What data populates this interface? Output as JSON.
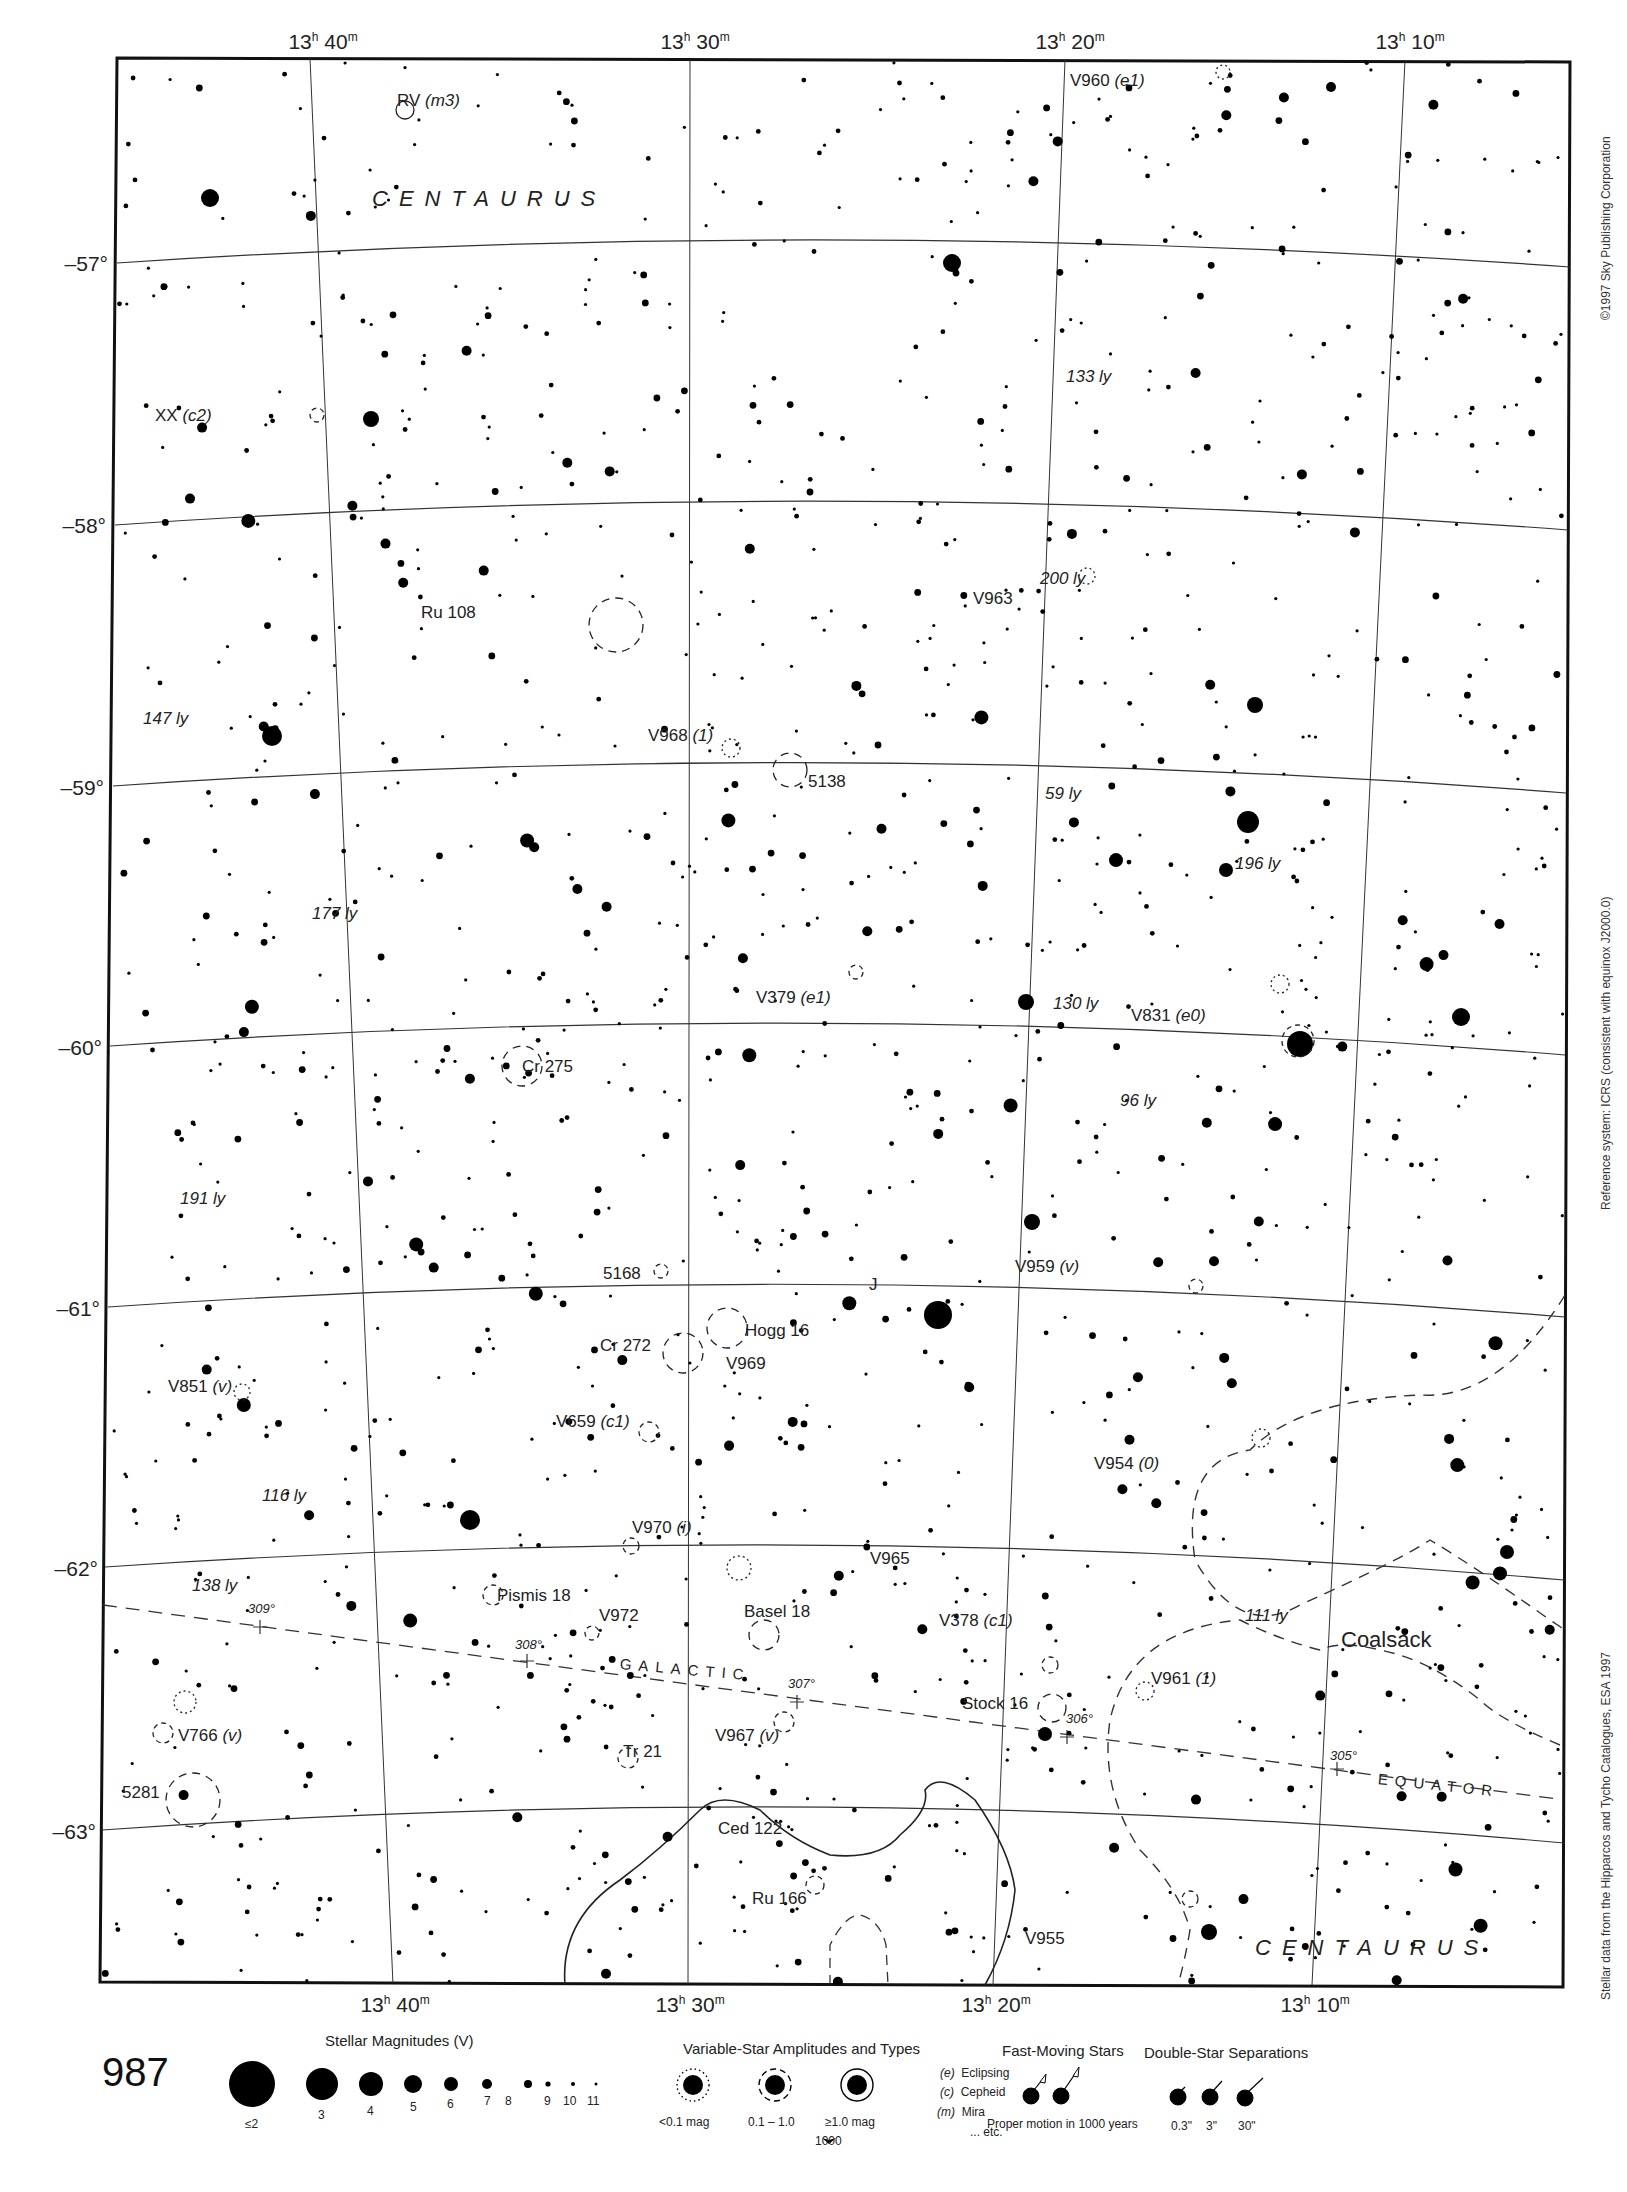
{
  "page": {
    "number": "987",
    "copyright": "©1997 Sky Publishing Corporation",
    "reference_system": "Reference system: ICRS (consistent with equinox J2000.0)",
    "data_source": "Stellar data from the Hipparcos and Tycho Catalogues, ESA 1997"
  },
  "axes": {
    "ra_top": [
      {
        "h": "13",
        "hs": "h",
        "m": " 40",
        "ms": "m"
      },
      {
        "h": "13",
        "hs": "h",
        "m": " 30",
        "ms": "m"
      },
      {
        "h": "13",
        "hs": "h",
        "m": " 20",
        "ms": "m"
      },
      {
        "h": "13",
        "hs": "h",
        "m": " 10",
        "ms": "m"
      }
    ],
    "ra_bottom": [
      {
        "h": "13",
        "hs": "h",
        "m": " 40",
        "ms": "m"
      },
      {
        "h": "13",
        "hs": "h",
        "m": " 30",
        "ms": "m"
      },
      {
        "h": "13",
        "hs": "h",
        "m": " 20",
        "ms": "m"
      },
      {
        "h": "13",
        "hs": "h",
        "m": " 10",
        "ms": "m"
      }
    ],
    "dec": [
      "–57°",
      "–58°",
      "–59°",
      "–60°",
      "–61°",
      "–62°",
      "–63°"
    ]
  },
  "constellations": {
    "top": "CENTAURUS",
    "bottom": "CENTAURUS"
  },
  "galactic_equator": {
    "word1": "GALACTIC",
    "word2": "EQUATOR",
    "longitudes": [
      "309°",
      "308°",
      "307°",
      "306°",
      "305°"
    ]
  },
  "nebula": {
    "coalsack": "Coalsack"
  },
  "objects": {
    "rv": {
      "name": "RV",
      "type": "(m3)"
    },
    "v960": {
      "name": "V960",
      "type": "(e1)"
    },
    "xx": {
      "name": "XX",
      "type": "(c2)"
    },
    "ru108": {
      "name": "Ru 108"
    },
    "v963": {
      "name": "V963"
    },
    "v968": {
      "name": "V968",
      "type": "(1)"
    },
    "ngc5138": {
      "name": "5138"
    },
    "v379": {
      "name": "V379",
      "type": "(e1)"
    },
    "v831": {
      "name": "V831",
      "type": "(e0)"
    },
    "cr275": {
      "name": "Cr 275"
    },
    "ngc5168": {
      "name": "5168"
    },
    "j": {
      "name": "J"
    },
    "v959": {
      "name": "V959",
      "type": "(v)"
    },
    "hogg16": {
      "name": "Hogg 16"
    },
    "cr272": {
      "name": "Cr 272"
    },
    "v969": {
      "name": "V969"
    },
    "v851": {
      "name": "V851",
      "type": "(v)"
    },
    "v659": {
      "name": "V659",
      "type": "(c1)"
    },
    "v954": {
      "name": "V954",
      "type": "(0)"
    },
    "v970": {
      "name": "V970",
      "type": "(i)"
    },
    "v965": {
      "name": "V965"
    },
    "pismis18": {
      "name": "Pismis 18"
    },
    "basel18": {
      "name": "Basel 18"
    },
    "v972": {
      "name": "V972"
    },
    "v378": {
      "name": "V378",
      "type": "(c1)"
    },
    "stock16": {
      "name": "Stock 16"
    },
    "v961": {
      "name": "V961",
      "type": "(1)"
    },
    "v967": {
      "name": "V967",
      "type": "(v)"
    },
    "v766": {
      "name": "V766",
      "type": "(v)"
    },
    "tr21": {
      "name": "Tr 21"
    },
    "ngc5281": {
      "name": "5281"
    },
    "ced122": {
      "name": "Ced 122"
    },
    "ru166": {
      "name": "Ru 166"
    },
    "v955": {
      "name": "V955"
    }
  },
  "distances": {
    "d133": "133 ly",
    "d200": "200 ly",
    "d147": "147 ly",
    "d59": "59 ly",
    "d196": "196 ly",
    "d177": "177 ly",
    "d130": "130 ly",
    "d96": "96 ly",
    "d191": "191 ly",
    "d116": "116 ly",
    "d138": "138 ly",
    "d111": "111 ly"
  },
  "legend": {
    "magnitudes": {
      "title": "Stellar Magnitudes (V)",
      "labels": [
        "≤2",
        "3",
        "4",
        "5",
        "6",
        "7",
        "8",
        "9",
        "10",
        "11"
      ]
    },
    "variables": {
      "title": "Variable-Star Amplitudes and Types",
      "amp_labels": [
        "<0.1 mag",
        "0.1 – 1.0",
        "≥1.0 mag"
      ],
      "types": [
        {
          "code": "(e)",
          "name": "Eclipsing"
        },
        {
          "code": "(c)",
          "name": "Cepheid"
        },
        {
          "code": "(m)",
          "name": "Mira"
        },
        {
          "code": "",
          "name": "... etc."
        }
      ],
      "marker": "1000"
    },
    "fast": {
      "title": "Fast-Moving Stars",
      "caption": "Proper motion in 1000 years"
    },
    "double": {
      "title": "Double-Star Separations",
      "labels": [
        "0.3\"",
        "3\"",
        "30\""
      ]
    }
  },
  "chart_data": {
    "type": "star-chart",
    "ra_range": [
      "13h 06m",
      "13h 44m"
    ],
    "dec_range": [
      "-56.4°",
      "-63.5°"
    ],
    "ra_gridlines": [
      "13h 40m",
      "13h 30m",
      "13h 20m",
      "13h 10m"
    ],
    "dec_gridlines": [
      -57,
      -58,
      -59,
      -60,
      -61,
      -62,
      -63
    ],
    "magnitude_scale": [
      2,
      3,
      4,
      5,
      6,
      7,
      8,
      9,
      10,
      11
    ],
    "galactic_longitude_ticks": [
      309,
      308,
      307,
      306,
      305
    ]
  }
}
